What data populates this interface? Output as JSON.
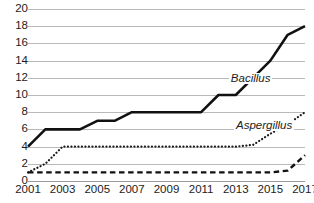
{
  "chart_data": {
    "type": "line",
    "title": "",
    "xlabel": "",
    "ylabel": "",
    "xlim": [
      2001,
      2017
    ],
    "ylim": [
      0,
      20
    ],
    "grid": true,
    "legend_position": "inline-annotation",
    "x": [
      2001,
      2002,
      2003,
      2004,
      2005,
      2006,
      2007,
      2008,
      2009,
      2010,
      2011,
      2012,
      2013,
      2014,
      2015,
      2016,
      2017
    ],
    "x_tick_labels": [
      "2001",
      "2003",
      "2005",
      "2007",
      "2009",
      "2011",
      "2013",
      "2015",
      "2017"
    ],
    "y_tick_labels": [
      "0",
      "2",
      "4",
      "6",
      "8",
      "10",
      "12",
      "14",
      "16",
      "18",
      "20"
    ],
    "y_ticks": [
      0,
      2,
      4,
      6,
      8,
      10,
      12,
      14,
      16,
      18,
      20
    ],
    "series": [
      {
        "name": "Bacillus",
        "style": "solid",
        "color": "#111111",
        "label_visible": true,
        "values": [
          4,
          6,
          6,
          6,
          7,
          7,
          8,
          8,
          8,
          8,
          8,
          10,
          10,
          12,
          14,
          17,
          18
        ]
      },
      {
        "name": "Aspergillus",
        "style": "dotted",
        "color": "#1a1a1a",
        "label_visible": true,
        "values": [
          1,
          2,
          4,
          4,
          4,
          4,
          4,
          4,
          4,
          4,
          4,
          4,
          4,
          4.2,
          5.5,
          6.6,
          8
        ]
      },
      {
        "name": "",
        "style": "dashed",
        "color": "#111111",
        "label_visible": false,
        "values": [
          1,
          1,
          1,
          1,
          1,
          1,
          1,
          1,
          1,
          1,
          1,
          1,
          1,
          1,
          1,
          1.2,
          3
        ]
      }
    ],
    "annotations": [
      {
        "text": "Bacillus",
        "x": 2012.6,
        "y": 12.6
      },
      {
        "text": "Aspergillus",
        "x": 2012.9,
        "y": 7.1
      }
    ]
  }
}
